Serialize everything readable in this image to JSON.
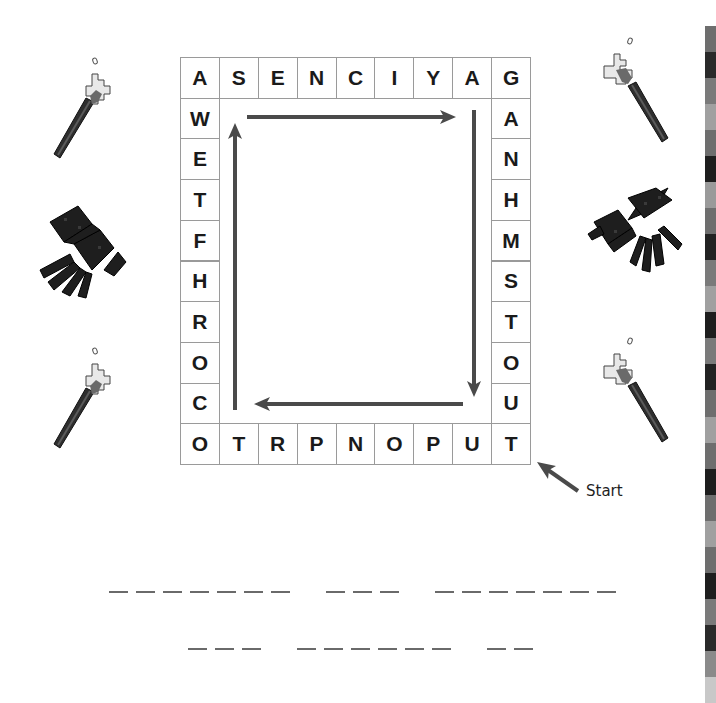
{
  "puzzle": {
    "title": "",
    "grid_cols": 9,
    "grid_rows": 10,
    "top_row": [
      "A",
      "S",
      "E",
      "N",
      "C",
      "I",
      "Y",
      "A",
      "G"
    ],
    "left_col": [
      "W",
      "E",
      "T",
      "F",
      "H",
      "R",
      "O",
      "C"
    ],
    "right_col": [
      "A",
      "N",
      "H",
      "M",
      "S",
      "T",
      "O",
      "U"
    ],
    "bottom_row": [
      "O",
      "T",
      "R",
      "P",
      "N",
      "O",
      "P",
      "U",
      "T"
    ],
    "start_label": "Start",
    "arrow_direction": "clockwise from bottom-right, reading letters in reverse"
  },
  "answer_blanks": {
    "line1": [
      7,
      3,
      7
    ],
    "line2": [
      3,
      6,
      2
    ]
  },
  "decorations": {
    "left": [
      "torch-icon",
      "spider-icon",
      "torch-icon"
    ],
    "right": [
      "torch-icon",
      "spider-icon",
      "torch-icon"
    ]
  },
  "side_strip_colors": [
    "#ffffff",
    "#6e6e6e",
    "#2a2a2a",
    "#7a7a7a",
    "#a0a0a0",
    "#6e6e6e",
    "#1e1e1e",
    "#9a9a9a",
    "#6e6e6e",
    "#222222",
    "#7a7a7a",
    "#a0a0a0",
    "#1e1e1e",
    "#7a7a7a",
    "#222222",
    "#6e6e6e",
    "#a0a0a0",
    "#6e6e6e",
    "#1e1e1e",
    "#6e6e6e",
    "#a0a0a0",
    "#6e6e6e",
    "#1e1e1e",
    "#7a7a7a",
    "#2a2a2a",
    "#8a8a8a",
    "#c8c8c8"
  ],
  "colors": {
    "grid_border": "#9a9a9a",
    "arrow": "#4a4a4a",
    "letter": "#1a1a1a"
  }
}
